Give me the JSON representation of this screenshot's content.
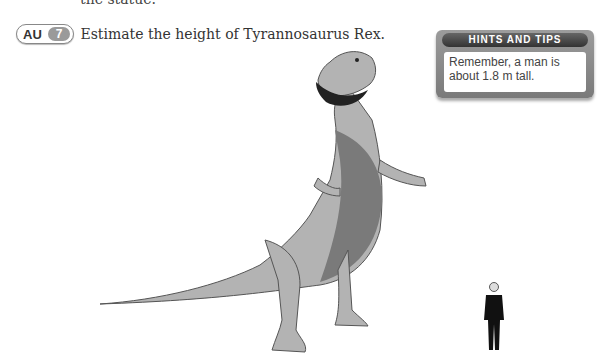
{
  "previous_text_fragment": "the statue.",
  "question": {
    "badge_label": "AU",
    "number": "7",
    "text": "Estimate the height of Tyrannosaurus Rex."
  },
  "hints_box": {
    "title": "HINTS AND TIPS",
    "body": "Remember, a man is about 1.8 m tall."
  },
  "illustrations": {
    "dinosaur": "tyrannosaurus-rex-illustration",
    "man": "standing-man-in-suit-illustration"
  }
}
